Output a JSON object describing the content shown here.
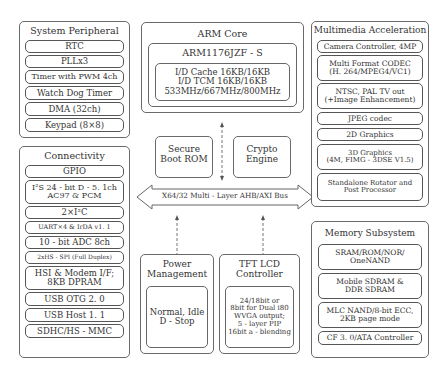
{
  "system_peripheral": {
    "title": "System Peripheral",
    "items": [
      "RTC",
      "PLLx3",
      "Timer with PWM 4ch",
      "Watch Dog Timer",
      "DMA (32ch)",
      "Keypad (8×8)"
    ]
  },
  "connectivity": {
    "title": "Connectivity",
    "items": [
      "GPIO",
      "I²S 24 - bit D - 5. 1ch\nAC97 & PCM",
      "2×I²C",
      "UART×4 & IrDA v1. 1",
      "10 - bit ADC 8ch",
      "2xHS - SPI (Full Duplex)",
      "HSI & Modem I/F;\n8KB DPRAM",
      "USB OTG 2. 0",
      "USB Host 1. 1",
      "SDHC/HS - MMC"
    ]
  },
  "arm_core": {
    "title": "ARM Core",
    "cpu": "ARM1176JZF - S",
    "details": "I/D Cache 16KB/16KB\nI/D TCM 16KB/16KB\n533MHz/667MHz/800MHz"
  },
  "secure_boot": {
    "label": "Secure\nBoot ROM"
  },
  "crypto": {
    "label": "Crypto\nEngine"
  },
  "bus": {
    "label": "X64/32 Multi - Layer AHB/AXI Bus"
  },
  "power": {
    "title": "Power\nManagement",
    "modes": "Normal, Idle\nD - Stop"
  },
  "tft": {
    "title": "TFT LCD\nController",
    "details": "24/18bit or\n8bit for Dual i80\nWVGA output;\n5 - layer PIP\n16bit a - blending"
  },
  "multimedia": {
    "title": "Multimedia Acceleration",
    "items": [
      "Camera Controller, 4MP",
      "Multi Format CODEC\n(H. 264/MPEG4/VC1)",
      "NTSC, PAL TV out\n(+Image Enhancement)",
      "JPEG codec",
      "2D Graphics",
      "3D Graphics\n(4M, FIMG - 3DSE V1.5)",
      "Standalone Rotator and\nPost Processor"
    ]
  },
  "memory": {
    "title": "Memory Subsystem",
    "items": [
      "SRAM/ROM/NOR/\nOneNAND",
      "Mobile SDRAM &\nDDR SDRAM",
      "MLC NAND/8-bit ECC,\n2KB page mode",
      "CF 3. 0/ATA Controller"
    ]
  },
  "colors": {
    "border": "#666666",
    "text": "#333333",
    "background": "#ffffff"
  }
}
